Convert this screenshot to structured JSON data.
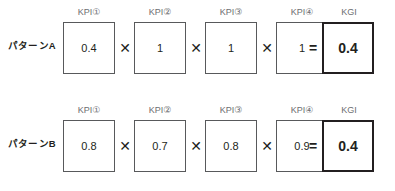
{
  "diagram": {
    "operators": {
      "multiply": "✕",
      "equals": "="
    },
    "rows": [
      {
        "id": "pattern-a",
        "label": "パターンA",
        "factors": [
          {
            "header": "KPI①",
            "value": "0.4"
          },
          {
            "header": "KPI②",
            "value": "1"
          },
          {
            "header": "KPI③",
            "value": "1"
          },
          {
            "header": "KPI④",
            "value": "1"
          }
        ],
        "result": {
          "header": "KGI",
          "value": "0.4"
        }
      },
      {
        "id": "pattern-b",
        "label": "パターンB",
        "factors": [
          {
            "header": "KPI①",
            "value": "0.8"
          },
          {
            "header": "KPI②",
            "value": "0.7"
          },
          {
            "header": "KPI③",
            "value": "0.8"
          },
          {
            "header": "KPI④",
            "value": "0.9"
          }
        ],
        "result": {
          "header": "KGI",
          "value": "0.4"
        }
      }
    ]
  },
  "colors": {
    "background": "#ffffff",
    "box_border": "#58595b",
    "kgi_border": "#231f20",
    "header_text": "#6d6e71",
    "value_text": "#231f20"
  }
}
